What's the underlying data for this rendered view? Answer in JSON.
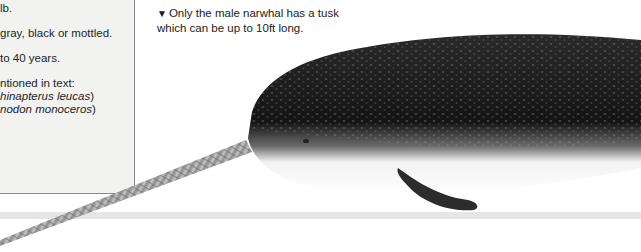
{
  "factbox": {
    "lines": [
      {
        "text": "lb.",
        "italic": false
      },
      {
        "text": "gray, black or mottled.",
        "italic": false
      },
      {
        "text": "to 40 years.",
        "italic": false
      },
      {
        "text": "ntioned in text:",
        "italic": false
      },
      {
        "text": "hinapterus leucas",
        "italic": true,
        "suffix": ")"
      },
      {
        "text": "nodon monoceros",
        "italic": true,
        "suffix": ")"
      }
    ]
  },
  "caption": {
    "marker": "▼",
    "line1": "Only the male narwhal has a tusk",
    "line2": "which can be up to 10ft long."
  },
  "illustration": {
    "subject": "narwhal",
    "description": "Illustration of a male narwhal with long spiral tusk"
  },
  "colors": {
    "factbox_bg": "#f2f2f0",
    "factbox_border": "#8a8a8a",
    "band": "#e6e6e4",
    "text": "#1e1e1e"
  }
}
